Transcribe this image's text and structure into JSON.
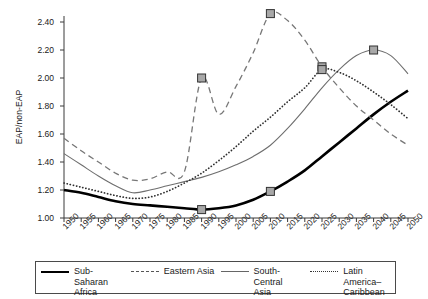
{
  "chart_data": {
    "type": "line",
    "title": "",
    "xlabel": "",
    "ylabel": "EAP/non-EAP",
    "xlim": [
      1950,
      2050
    ],
    "ylim": [
      1.0,
      2.4
    ],
    "grid": false,
    "legend_position": "bottom",
    "x": [
      1950,
      1955,
      1960,
      1965,
      1970,
      1975,
      1980,
      1985,
      1990,
      1995,
      2000,
      2005,
      2010,
      2015,
      2020,
      2025,
      2030,
      2035,
      2040,
      2045,
      2050
    ],
    "yticks": [
      "1.00",
      "1.20",
      "1.40",
      "1.60",
      "1.80",
      "2.00",
      "2.20",
      "2.40"
    ],
    "xticks": [
      "1950",
      "1955",
      "1960",
      "1965",
      "1970",
      "1975",
      "1980",
      "1985",
      "1990",
      "1995",
      "2000",
      "2005",
      "2010",
      "2015",
      "2020",
      "2025",
      "2030",
      "2035",
      "2040",
      "2045",
      "2050"
    ],
    "series": [
      {
        "name": "Sub-Saharan Africa",
        "style": "solid-thick",
        "color": "#000000",
        "values": [
          1.2,
          1.18,
          1.15,
          1.12,
          1.1,
          1.09,
          1.08,
          1.07,
          1.06,
          1.07,
          1.09,
          1.13,
          1.19,
          1.26,
          1.34,
          1.44,
          1.54,
          1.64,
          1.74,
          1.83,
          1.91
        ],
        "markers": [
          {
            "x": 1990,
            "y": 1.06
          },
          {
            "x": 2010,
            "y": 1.19
          }
        ]
      },
      {
        "name": "Eastern Asia",
        "style": "dashed",
        "color": "#777777",
        "values": [
          1.57,
          1.48,
          1.4,
          1.32,
          1.27,
          1.28,
          1.33,
          1.33,
          2.0,
          1.74,
          1.94,
          2.18,
          2.46,
          2.41,
          2.27,
          2.08,
          1.93,
          1.8,
          1.7,
          1.6,
          1.52
        ],
        "markers": [
          {
            "x": 1990,
            "y": 2.0
          },
          {
            "x": 2010,
            "y": 2.46
          },
          {
            "x": 2025,
            "y": 2.08
          }
        ]
      },
      {
        "name": "South-Central Asia",
        "style": "solid-thin",
        "color": "#6e6e6e",
        "values": [
          1.46,
          1.38,
          1.3,
          1.23,
          1.18,
          1.2,
          1.23,
          1.26,
          1.29,
          1.33,
          1.38,
          1.44,
          1.52,
          1.64,
          1.78,
          1.93,
          2.06,
          2.16,
          2.2,
          2.16,
          2.03
        ],
        "markers": [
          {
            "x": 2040,
            "y": 2.2
          }
        ]
      },
      {
        "name": "Latin America–Caribbean",
        "style": "dotted",
        "color": "#2f2f2f",
        "values": [
          1.25,
          1.22,
          1.19,
          1.16,
          1.14,
          1.15,
          1.19,
          1.25,
          1.32,
          1.41,
          1.51,
          1.62,
          1.72,
          1.83,
          1.93,
          2.06,
          2.04,
          1.98,
          1.9,
          1.81,
          1.71
        ],
        "markers": [
          {
            "x": 2025,
            "y": 2.06
          }
        ]
      }
    ]
  },
  "legend": {
    "items": [
      {
        "label": "Sub-Saharan\nAfrica",
        "style": "solid-thick"
      },
      {
        "label": "Eastern Asia",
        "style": "dashed"
      },
      {
        "label": "South-Central\nAsia",
        "style": "solid-thin"
      },
      {
        "label": "Latin America–\nCaribbean",
        "style": "dotted"
      }
    ]
  }
}
